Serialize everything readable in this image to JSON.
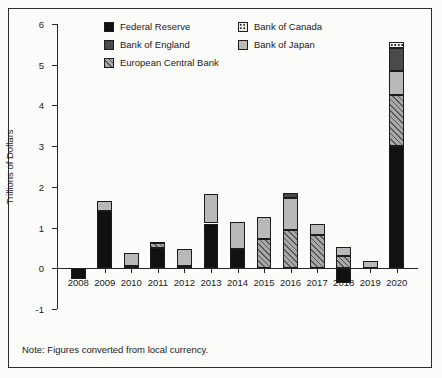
{
  "axis": {
    "ylabel": "Trillions of Dollars",
    "yticks": [
      "-1",
      "0",
      "1",
      "2",
      "3",
      "4",
      "5",
      "6"
    ],
    "ymin": -1,
    "ymax": 6
  },
  "legend": {
    "column1": [
      {
        "label": "Federal Reserve",
        "key": "fed",
        "swatch": "solid-black-swatch",
        "color": "#111111"
      },
      {
        "label": "Bank of England",
        "key": "boe",
        "swatch": "dark-gray-swatch",
        "color": "#4a4a4a"
      },
      {
        "label": "European Central Bank",
        "key": "ecb",
        "swatch": "diagonal-hatch-swatch",
        "color": "#a8a8a8"
      }
    ],
    "column2": [
      {
        "label": "Bank of Canada",
        "key": "boc",
        "swatch": "dotted-swatch",
        "color": "#f2f2f2"
      },
      {
        "label": "Bank of Japan",
        "key": "boj",
        "swatch": "light-gray-swatch",
        "color": "#b9b9b9"
      }
    ]
  },
  "note": "Note: Figures converted from local currency.",
  "chart_data": {
    "type": "bar",
    "subtype": "stacked-bar",
    "title": "",
    "xlabel": "",
    "ylabel": "Trillions of Dollars",
    "ylim": [
      -1,
      6
    ],
    "yticks": [
      -1,
      0,
      1,
      2,
      3,
      4,
      5,
      6
    ],
    "grid": false,
    "legend_position": "top-center",
    "categories": [
      "2008",
      "2009",
      "2010",
      "2011",
      "2012",
      "2013",
      "2014",
      "2015",
      "2016",
      "2017",
      "2018",
      "2019",
      "2020"
    ],
    "series": [
      {
        "name": "Federal Reserve",
        "key": "fed",
        "color": "#111111",
        "pattern": "solid",
        "values": [
          -0.27,
          1.4,
          0.05,
          0.5,
          0.05,
          1.1,
          0.48,
          0.0,
          0.0,
          0.0,
          -0.37,
          0.0,
          3.0
        ]
      },
      {
        "name": "European Central Bank",
        "key": "ecb",
        "color": "#a8a8a8",
        "pattern": "diagonal-hatch",
        "values": [
          0.0,
          0.0,
          0.0,
          0.12,
          0.0,
          0.0,
          0.0,
          0.72,
          0.94,
          0.81,
          0.3,
          0.0,
          1.25
        ]
      },
      {
        "name": "Bank of Japan",
        "key": "boj",
        "color": "#b9b9b9",
        "pattern": "solid",
        "values": [
          0.0,
          0.25,
          0.33,
          0.03,
          0.43,
          0.72,
          0.65,
          0.53,
          0.78,
          0.28,
          0.22,
          0.17,
          0.6
        ]
      },
      {
        "name": "Bank of England",
        "key": "boe",
        "color": "#4a4a4a",
        "pattern": "solid",
        "values": [
          0.0,
          0.0,
          0.0,
          0.0,
          0.0,
          0.0,
          0.0,
          0.0,
          0.12,
          0.0,
          0.0,
          0.0,
          0.55
        ]
      },
      {
        "name": "Bank of Canada",
        "key": "boc",
        "color": "#f2f2f2",
        "pattern": "dotted",
        "values": [
          0.0,
          0.0,
          0.0,
          0.0,
          0.0,
          0.0,
          0.0,
          0.0,
          0.0,
          0.0,
          0.0,
          0.0,
          0.15
        ]
      }
    ],
    "totals": [
      -0.27,
      1.65,
      0.38,
      0.65,
      0.48,
      1.82,
      1.13,
      1.25,
      1.84,
      1.09,
      0.52,
      0.17,
      5.55
    ],
    "annotations": [
      "Note: Figures converted from local currency."
    ]
  }
}
